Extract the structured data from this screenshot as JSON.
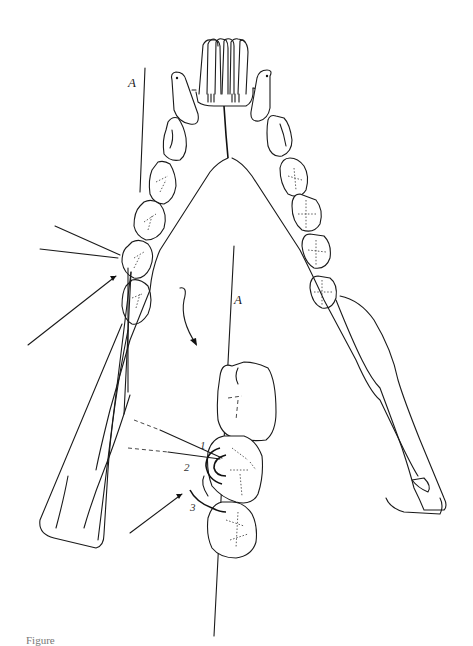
{
  "figure": {
    "labels": {
      "axis_upper": "A",
      "axis_lower": "A",
      "region_1": "1",
      "region_2": "2",
      "region_3": "3"
    },
    "caption_partial": "Figure"
  },
  "colors": {
    "ink": "#1a1a1a",
    "background": "#ffffff"
  }
}
